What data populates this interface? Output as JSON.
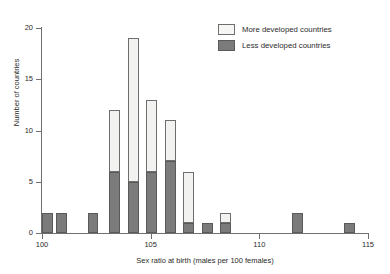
{
  "chart_data": {
    "type": "bar",
    "title": "",
    "subtitle": "",
    "xlabel": "Sex ratio at birth (males per 100 females)",
    "ylabel": "Number of countries",
    "xlim": [
      100,
      115
    ],
    "ylim": [
      0,
      20
    ],
    "xticks": [
      100,
      105,
      110,
      115
    ],
    "yticks": [
      0,
      5,
      10,
      15,
      20
    ],
    "grid": false,
    "stacked": true,
    "bin_width": 0.5,
    "legend_position": "top-right",
    "legend": [
      "More developed countries",
      "Less developed countries"
    ],
    "series": [
      {
        "name": "Less developed countries",
        "color": "#7b7b7b",
        "values": [
          2,
          2,
          0,
          0,
          2,
          6,
          5,
          6,
          7,
          1,
          1,
          1,
          0,
          0,
          2,
          0,
          1
        ]
      },
      {
        "name": "More developed countries",
        "color": "#f2f2f0",
        "values": [
          0,
          0,
          0,
          0,
          0,
          6,
          14,
          7,
          4,
          5,
          0,
          1,
          0,
          0,
          0,
          0,
          0
        ]
      }
    ],
    "bins": [
      {
        "start": 100.0,
        "end": 100.5,
        "less": 2,
        "more": 0,
        "total": 2
      },
      {
        "start": 100.5,
        "end": 101.0,
        "less": 2,
        "more": 0,
        "total": 2
      },
      {
        "start": 101.0,
        "end": 101.5,
        "less": 0,
        "more": 0,
        "total": 0
      },
      {
        "start": 101.5,
        "end": 102.0,
        "less": 0,
        "more": 0,
        "total": 0
      },
      {
        "start": 102.0,
        "end": 102.5,
        "less": 2,
        "more": 0,
        "total": 2
      },
      {
        "start": 103.5,
        "end": 104.0,
        "less": 6,
        "more": 6,
        "total": 12
      },
      {
        "start": 104.0,
        "end": 104.5,
        "less": 5,
        "more": 14,
        "total": 19
      },
      {
        "start": 105.0,
        "end": 105.5,
        "less": 6,
        "more": 7,
        "total": 13
      },
      {
        "start": 105.5,
        "end": 106.0,
        "less": 7,
        "more": 4,
        "total": 11
      },
      {
        "start": 106.5,
        "end": 107.0,
        "less": 1,
        "more": 5,
        "total": 6
      },
      {
        "start": 107.5,
        "end": 108.0,
        "less": 1,
        "more": 0,
        "total": 1
      },
      {
        "start": 108.5,
        "end": 109.0,
        "less": 1,
        "more": 1,
        "total": 2
      },
      {
        "start": 112.0,
        "end": 112.5,
        "less": 2,
        "more": 0,
        "total": 2
      },
      {
        "start": 114.0,
        "end": 114.5,
        "less": 1,
        "more": 0,
        "total": 1
      }
    ],
    "bars": [
      {
        "x": 100.0,
        "less": 2,
        "more": 0
      },
      {
        "x": 100.65,
        "less": 2,
        "more": 0
      },
      {
        "x": 102.1,
        "less": 2,
        "more": 0
      },
      {
        "x": 103.1,
        "less": 6,
        "more": 6
      },
      {
        "x": 103.95,
        "less": 5,
        "more": 14
      },
      {
        "x": 104.8,
        "less": 6,
        "more": 7
      },
      {
        "x": 105.65,
        "less": 7,
        "more": 4
      },
      {
        "x": 106.5,
        "less": 1,
        "more": 5
      },
      {
        "x": 107.35,
        "less": 1,
        "more": 0
      },
      {
        "x": 108.2,
        "less": 1,
        "more": 1
      },
      {
        "x": 111.5,
        "less": 2,
        "more": 0
      },
      {
        "x": 113.9,
        "less": 1,
        "more": 0
      }
    ]
  },
  "axes": {
    "y_tick_labels": [
      "0",
      "5",
      "10",
      "15",
      "20"
    ],
    "x_tick_labels": [
      "100",
      "105",
      "110",
      "115"
    ],
    "x_title": "Sex ratio at birth (males per 100 females)",
    "y_title": "Number of countries"
  },
  "legend": {
    "items": [
      {
        "label": "More developed countries",
        "swatch": "more"
      },
      {
        "label": "Less developed countries",
        "swatch": "less"
      }
    ]
  }
}
